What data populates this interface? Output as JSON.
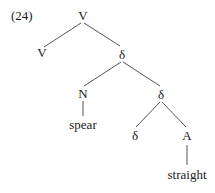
{
  "example": {
    "number": "(24)"
  },
  "tree": {
    "nodes": {
      "root": {
        "label": "V"
      },
      "v_left": {
        "label": "V"
      },
      "delta_1": {
        "label": "δ"
      },
      "n": {
        "label": "N"
      },
      "delta_2": {
        "label": "δ"
      },
      "spear": {
        "label": "spear"
      },
      "delta_3": {
        "label": "δ"
      },
      "a": {
        "label": "A"
      },
      "straight": {
        "label": "straight"
      }
    },
    "edges": [
      [
        "root",
        "v_left"
      ],
      [
        "root",
        "delta_1"
      ],
      [
        "delta_1",
        "n"
      ],
      [
        "delta_1",
        "delta_2"
      ],
      [
        "n",
        "spear"
      ],
      [
        "delta_2",
        "delta_3"
      ],
      [
        "delta_2",
        "a"
      ],
      [
        "a",
        "straight"
      ]
    ]
  },
  "colors": {
    "text": "#1a1a1a",
    "edge": "#555555",
    "background": "#ffffff"
  }
}
